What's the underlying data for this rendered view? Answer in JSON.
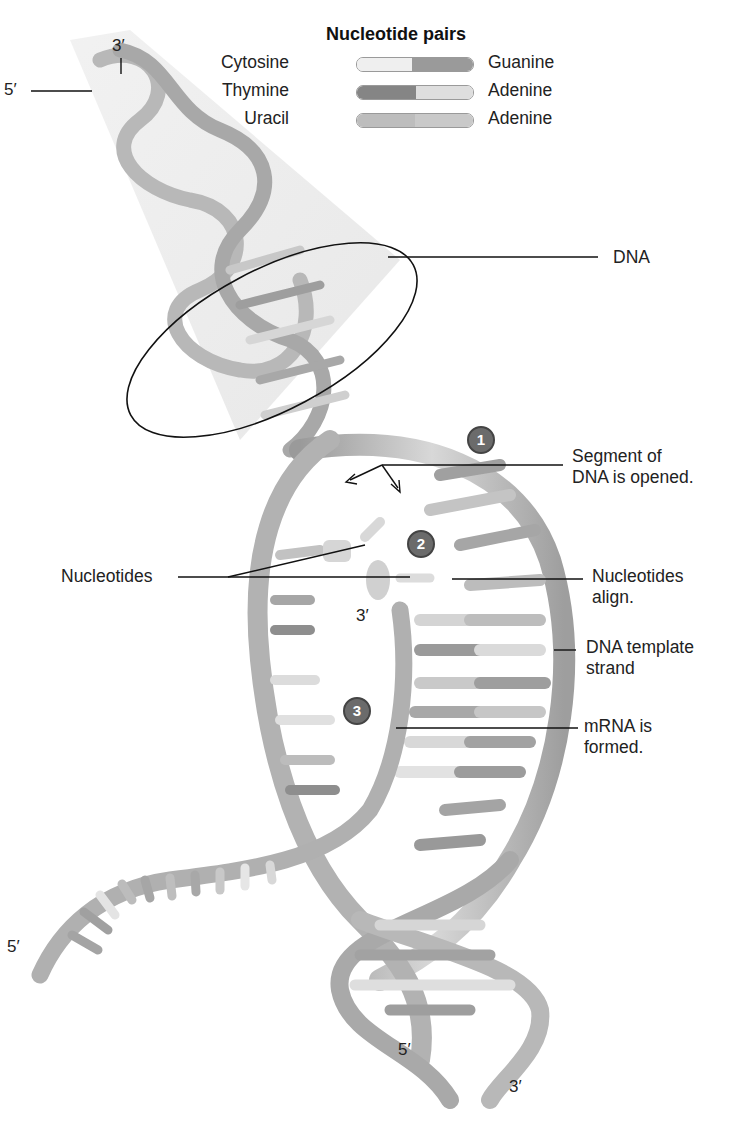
{
  "legend": {
    "title": "Nucleotide pairs",
    "rows": [
      {
        "left": "Cytosine",
        "right": "Guanine",
        "left_color": "#efefef",
        "right_color": "#9a9a9a"
      },
      {
        "left": "Thymine",
        "right": "Adenine",
        "left_color": "#858585",
        "right_color": "#dedede"
      },
      {
        "left": "Uracil",
        "right": "Adenine",
        "left_color": "#bdbdbd",
        "right_color": "#c9c9c9"
      }
    ]
  },
  "strand_ends": {
    "top_three_prime": "3′",
    "top_five_prime": "5′",
    "mrna_three_prime": "3′",
    "mrna_five_prime": "5′",
    "bottom_five_prime": "5′",
    "bottom_three_prime": "3′"
  },
  "labels": {
    "dna": "DNA",
    "segment_line1": "Segment of",
    "segment_line2": "DNA is opened.",
    "nucleotides": "Nucleotides",
    "align_line1": "Nucleotides",
    "align_line2": "align.",
    "template_line1": "DNA template",
    "template_line2": "strand",
    "mrna_line1": "mRNA is",
    "mrna_line2": "formed."
  },
  "steps": [
    {
      "number": "1"
    },
    {
      "number": "2"
    },
    {
      "number": "3"
    }
  ],
  "colors": {
    "backbone": "#b5b5b5",
    "backbone_dark": "#8c8c8c",
    "step_circle": "#6b6b6b",
    "leader_line": "#111111",
    "cone": "#e6e6e6"
  }
}
